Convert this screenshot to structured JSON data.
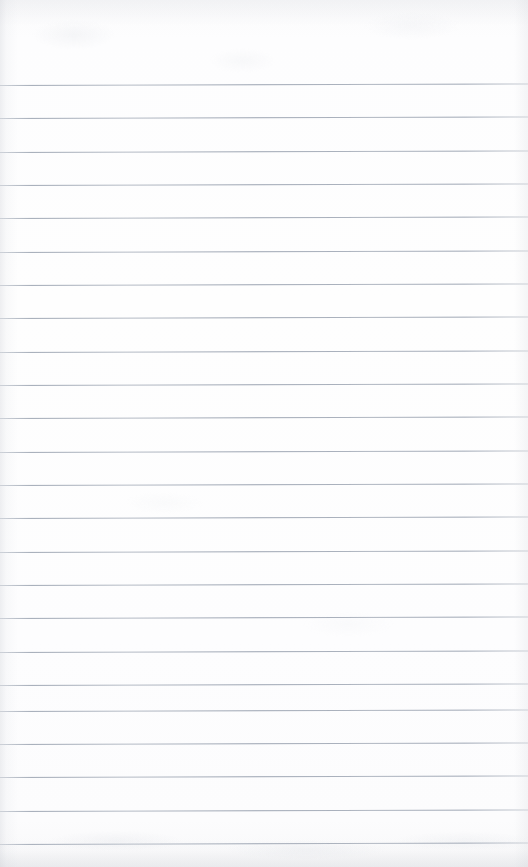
{
  "document": {
    "type": "scanned-page",
    "kind": "blank-ruled-notebook-paper",
    "width": 528,
    "height": 867,
    "has_text": false,
    "has_handwriting": false,
    "visible_text": ""
  },
  "paper": {
    "background_color": "#fdfdfe",
    "edge_shadow_color": "#c8cbd2",
    "grain_color": "#e4e6ea"
  },
  "ruling": {
    "line_color": "#949db0",
    "line_thickness_px": 1,
    "line_spacing_px": 33.4,
    "first_line_y_px": 85,
    "slant_degrees": -0.17,
    "line_count": 23,
    "margin_rule": false,
    "line_y_positions": [
      85,
      118,
      152,
      185,
      218,
      252,
      285,
      318,
      352,
      385,
      418,
      452,
      485,
      518,
      552,
      585,
      618,
      652,
      685,
      711,
      744,
      777,
      811,
      844
    ]
  }
}
